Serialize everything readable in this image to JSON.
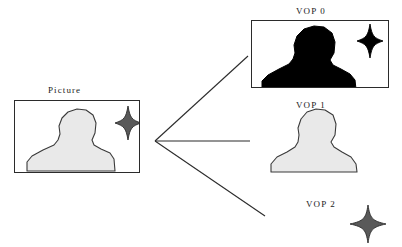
{
  "diagram": {
    "title_present": false,
    "colors": {
      "silhouette_fill": "#e9e9e9",
      "silhouette_stroke": "#3a3a3a",
      "star_fill": "#595959",
      "star_stroke": "#2b2b2b",
      "vop0_fill": "#000000",
      "frame_stroke": "#2b2b2b",
      "line_stroke": "#2b2b2b",
      "background": "#ffffff",
      "text": "#1a1a1a"
    }
  },
  "nodes": {
    "picture": {
      "label": "Picture",
      "label_x": 48,
      "label_y": 86,
      "box": {
        "x": 14,
        "y": 100,
        "w": 126,
        "h": 73
      },
      "has_frame": true,
      "contents": [
        "person-silhouette",
        "star-shape"
      ]
    },
    "vop0": {
      "label": "VOP 0",
      "label_x": 296,
      "label_y": 7,
      "box": {
        "x": 251,
        "y": 20,
        "w": 138,
        "h": 68
      },
      "has_frame": true,
      "contents": [
        "person-silhouette",
        "star-shape"
      ]
    },
    "vop1": {
      "label": "VOP 1",
      "label_x": 296,
      "label_y": 101,
      "box": {
        "x": 268,
        "y": 108,
        "w": 94,
        "h": 66
      },
      "has_frame": false,
      "contents": [
        "person-silhouette"
      ]
    },
    "vop2": {
      "label": "VOP 2",
      "label_x": 306,
      "label_y": 200,
      "box": {
        "x": 350,
        "y": 205,
        "w": 36,
        "h": 36
      },
      "has_frame": false,
      "contents": [
        "star-shape"
      ]
    }
  },
  "connectors": {
    "vertex": {
      "x": 155,
      "y": 141
    },
    "lines": [
      {
        "name": "connector-to-vop0",
        "x1": 155,
        "y1": 141,
        "x2": 248,
        "y2": 56
      },
      {
        "name": "connector-to-vop1",
        "x1": 155,
        "y1": 141,
        "x2": 250,
        "y2": 141
      },
      {
        "name": "connector-to-vop2",
        "x1": 155,
        "y1": 141,
        "x2": 265,
        "y2": 216
      }
    ]
  }
}
